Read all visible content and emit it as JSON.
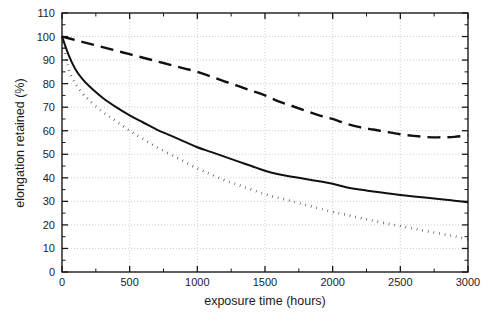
{
  "chart_data": {
    "type": "line",
    "title": "",
    "xlabel": "exposure time (hours)",
    "ylabel": "elongation retained (%)",
    "xlim": [
      0,
      3000
    ],
    "ylim": [
      0,
      110
    ],
    "xticks": [
      0,
      500,
      1000,
      1500,
      2000,
      2500,
      3000
    ],
    "xtick_labels": [
      "0",
      "500",
      "1000",
      "1500",
      "2000",
      "2500",
      "3000"
    ],
    "x_minor_tick_step": 250,
    "yticks": [
      0,
      10,
      20,
      30,
      40,
      50,
      60,
      70,
      80,
      90,
      100,
      110
    ],
    "ytick_labels": [
      "0",
      "10",
      "20",
      "30",
      "40",
      "50",
      "60",
      "70",
      "80",
      "90",
      "100",
      "110"
    ],
    "y_minor_tick_step": 5,
    "grid": true,
    "grid_axis": "y",
    "legend": "none",
    "line_color": "#111111",
    "series": [
      {
        "name": "dashed-curve",
        "style": "dashed",
        "x": [
          0,
          100,
          200,
          300,
          400,
          500,
          600,
          700,
          800,
          900,
          1000,
          1100,
          1200,
          1300,
          1400,
          1500,
          1600,
          1700,
          1800,
          1900,
          2000,
          2100,
          2200,
          2300,
          2400,
          2500,
          2600,
          2700,
          2800,
          2900,
          3000
        ],
        "values": [
          100,
          98.5,
          97,
          95.5,
          94,
          92.5,
          91,
          89.5,
          88,
          86.5,
          85,
          83,
          81,
          79,
          77,
          75,
          72.5,
          70.5,
          68.5,
          66.5,
          65,
          63,
          61.5,
          60.5,
          59.5,
          58.5,
          57.8,
          57.3,
          57.2,
          57.4,
          58
        ]
      },
      {
        "name": "solid-curve",
        "style": "solid",
        "x": [
          0,
          50,
          100,
          150,
          200,
          300,
          400,
          500,
          600,
          700,
          800,
          900,
          1000,
          1100,
          1200,
          1300,
          1400,
          1500,
          1600,
          1700,
          1800,
          1900,
          2000,
          2100,
          2200,
          2300,
          2400,
          2500,
          2600,
          2700,
          2800,
          2900,
          3000
        ],
        "values": [
          100,
          92,
          86,
          82,
          79,
          74,
          70,
          66.5,
          63.5,
          60.5,
          58,
          55.5,
          53,
          51,
          49,
          47,
          45,
          43,
          41.5,
          40.5,
          39.5,
          38.5,
          37.5,
          36,
          35,
          34.2,
          33.4,
          32.7,
          32.1,
          31.5,
          30.9,
          30.3,
          29.6
        ]
      },
      {
        "name": "dotted-curve",
        "style": "dotted",
        "x": [
          0,
          50,
          100,
          150,
          200,
          300,
          400,
          500,
          600,
          700,
          800,
          900,
          1000,
          1100,
          1200,
          1300,
          1400,
          1500,
          1600,
          1700,
          1800,
          1900,
          2000,
          2100,
          2200,
          2300,
          2400,
          2500,
          2600,
          2700,
          2800,
          2900,
          3000
        ],
        "values": [
          100,
          86,
          80,
          76,
          73,
          68,
          64,
          60,
          56.5,
          53,
          50,
          47,
          44,
          41.5,
          39,
          37,
          35,
          33,
          31.5,
          30,
          28.5,
          27,
          25.5,
          24.3,
          23,
          21.8,
          20.6,
          19.5,
          18.4,
          17.3,
          16.2,
          15.2,
          13.8
        ]
      }
    ]
  },
  "plot_geometry": {
    "left": 62,
    "top": 13,
    "right": 468,
    "bottom": 272
  }
}
